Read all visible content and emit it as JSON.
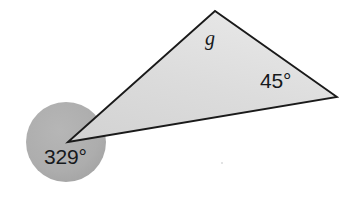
{
  "figure": {
    "kind": "geometry-diagram",
    "background_color": "#ffffff",
    "canvas": {
      "width": 350,
      "height": 203
    },
    "circle": {
      "name": "reflex-angle-marker",
      "center_x": 66,
      "center_y": 142,
      "radius": 40,
      "fill_color": "#adadad"
    },
    "triangle": {
      "name": "shaded-triangle",
      "fill_color": "#dcdcdc",
      "stroke_color": "#1a1a1a",
      "stroke_width": 1.8,
      "vertices": [
        {
          "name": "left-vertex",
          "x": 68,
          "y": 142
        },
        {
          "name": "apex-vertex",
          "x": 215,
          "y": 11
        },
        {
          "name": "right-vertex",
          "x": 337,
          "y": 97
        }
      ]
    },
    "labels": {
      "reflex_angle": "329°",
      "right_angle": "45°",
      "apex_angle": "g"
    }
  }
}
